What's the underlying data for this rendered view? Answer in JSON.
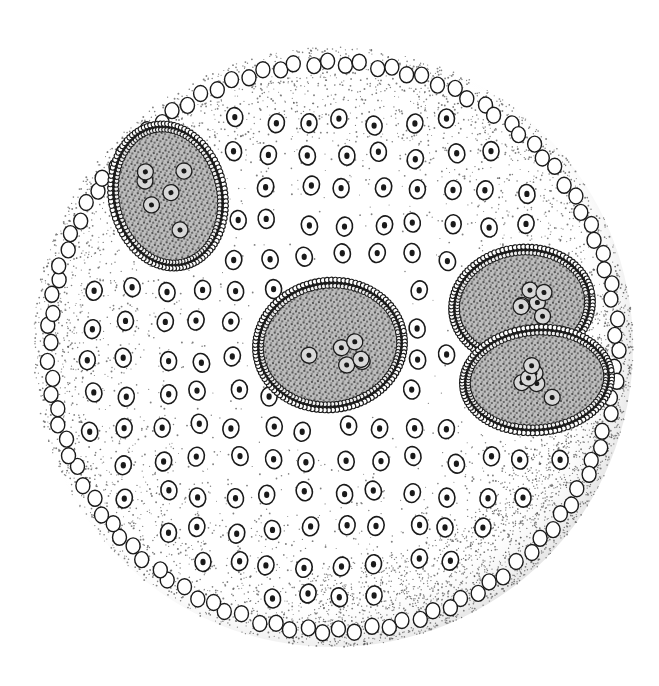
{
  "illustration": {
    "subject": "Spherical green-alga colony (Volvox) with daughter colonies",
    "background": "#ffffff",
    "ink": "#1a1a1a",
    "colony": {
      "cx": 333,
      "cy": 347,
      "r": 300
    },
    "daughter_colonies": [
      {
        "name": "daughter-colony-upper-left",
        "cx": 168,
        "cy": 196,
        "rx": 54,
        "ry": 70,
        "rot": -12
      },
      {
        "name": "daughter-colony-center",
        "cx": 330,
        "cy": 345,
        "rx": 72,
        "ry": 62,
        "rot": -8
      },
      {
        "name": "daughter-colony-right-upper",
        "cx": 522,
        "cy": 305,
        "rx": 68,
        "ry": 55,
        "rot": -8
      },
      {
        "name": "daughter-colony-right-lower",
        "cx": 537,
        "cy": 380,
        "rx": 72,
        "ry": 50,
        "rot": -5
      }
    ]
  }
}
